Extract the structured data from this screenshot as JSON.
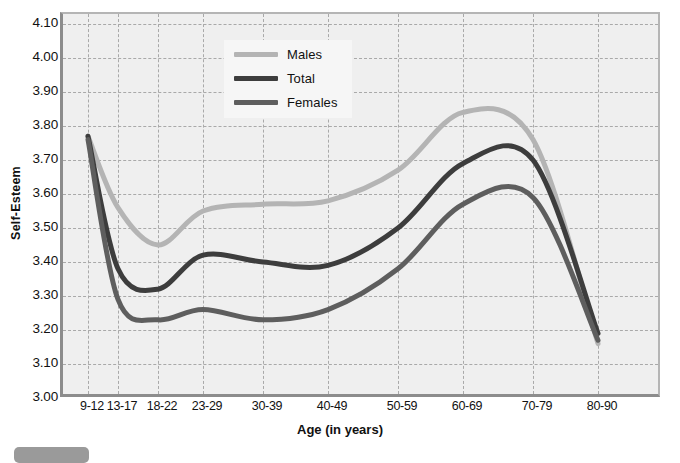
{
  "chart_data": {
    "type": "line",
    "title": "",
    "xlabel": "Age (in years)",
    "ylabel": "Self-Esteem",
    "categories": [
      "9-12",
      "13-17",
      "18-22",
      "23-29",
      "30-39",
      "40-49",
      "50-59",
      "60-69",
      "70-79",
      "80-90"
    ],
    "ylim": [
      3.0,
      4.1
    ],
    "ytick_step": 0.1,
    "yticks": [
      "3.00",
      "3.10",
      "3.20",
      "3.30",
      "3.40",
      "3.50",
      "3.60",
      "3.70",
      "3.80",
      "3.90",
      "4.00",
      "4.10"
    ],
    "grid": true,
    "legend_position": "top-center",
    "series": [
      {
        "name": "Males",
        "color": "#b4b4b4",
        "values": [
          3.77,
          3.56,
          3.45,
          3.55,
          3.57,
          3.58,
          3.67,
          3.84,
          3.76,
          3.16
        ]
      },
      {
        "name": "Total",
        "color": "#3d3d3d",
        "values": [
          3.77,
          3.38,
          3.32,
          3.42,
          3.4,
          3.39,
          3.5,
          3.69,
          3.7,
          3.19
        ]
      },
      {
        "name": "Females",
        "color": "#5e5e5e",
        "values": [
          3.76,
          3.29,
          3.23,
          3.26,
          3.23,
          3.26,
          3.38,
          3.57,
          3.59,
          3.17
        ]
      }
    ]
  },
  "legend": {
    "items": [
      {
        "label": "Males"
      },
      {
        "label": "Total"
      },
      {
        "label": "Females"
      }
    ]
  },
  "axes": {
    "y_title": "Self-Esteem",
    "x_title": "Age (in years)"
  }
}
